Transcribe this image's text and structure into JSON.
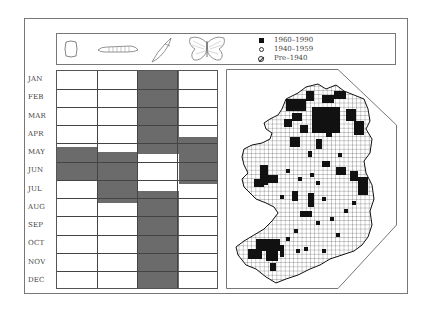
{
  "figure": {
    "type": "species phenology and distribution plate"
  },
  "header": {
    "life_stages": [
      {
        "name": "egg",
        "icon": "egg-icon"
      },
      {
        "name": "larva",
        "icon": "larva-icon"
      },
      {
        "name": "pupa",
        "icon": "pupa-icon"
      },
      {
        "name": "adult",
        "icon": "butterfly-icon"
      }
    ],
    "legend": [
      {
        "symbol": "filled-square",
        "label": "1960–1990"
      },
      {
        "symbol": "open-circle",
        "label": "1940–1959"
      },
      {
        "symbol": "slashed-circle",
        "label": "Pre–1940"
      }
    ]
  },
  "calendar": {
    "months": [
      "JAN",
      "FEB",
      "MAR",
      "APR",
      "MAY",
      "JUN",
      "JUL",
      "AUG",
      "SEP",
      "OCT",
      "NOV",
      "DEC"
    ],
    "shade_color": "#6b6b6b",
    "columns": [
      {
        "stage": "egg",
        "active": [
          {
            "from": "mid-APR",
            "to": "early-JUL"
          }
        ]
      },
      {
        "stage": "larva",
        "active": [
          {
            "from": "late-APR",
            "to": "late-JUL"
          }
        ]
      },
      {
        "stage": "pupa",
        "active": [
          {
            "from": "JAN",
            "to": "late-APR"
          },
          {
            "from": "mid-JUL",
            "to": "DEC"
          }
        ]
      },
      {
        "stage": "adult",
        "active": [
          {
            "from": "mid-APR",
            "to": "mid-JUN"
          }
        ]
      }
    ]
  },
  "map": {
    "region": "Ireland",
    "grid": "10km squares",
    "legend_key": "1960–1990 records shown as filled squares"
  }
}
